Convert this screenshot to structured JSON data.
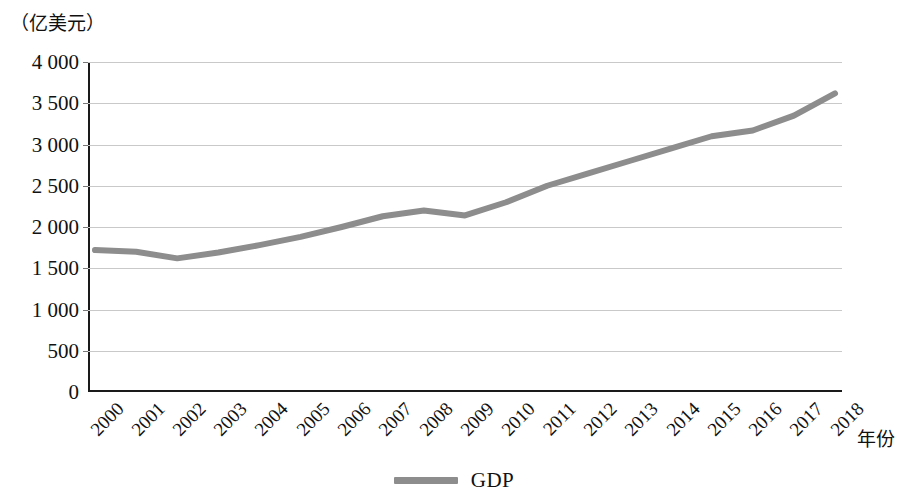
{
  "chart_data": {
    "type": "line",
    "title": "",
    "subtitle": "",
    "xlabel": "年份",
    "ylabel": "（亿美元）",
    "y_unit_caption": "（亿美元）",
    "categories": [
      "2000",
      "2001",
      "2002",
      "2003",
      "2004",
      "2005",
      "2006",
      "2007",
      "2008",
      "2009",
      "2010",
      "2011",
      "2012",
      "2013",
      "2014",
      "2015",
      "2016",
      "2017",
      "2018"
    ],
    "series": [
      {
        "name": "GDP",
        "color": "#8d8d8d",
        "values": [
          1720,
          1700,
          1620,
          1690,
          1780,
          1880,
          2000,
          2130,
          2200,
          2140,
          2300,
          2500,
          2650,
          2800,
          2950,
          3100,
          3170,
          3350,
          3620
        ]
      }
    ],
    "ylim": [
      0,
      4000
    ],
    "ytick_values": [
      0,
      500,
      1000,
      1500,
      2000,
      2500,
      3000,
      3500,
      4000
    ],
    "ytick_labels": [
      "0",
      "500",
      "1 000",
      "1 500",
      "2 000",
      "2 500",
      "3 000",
      "3 500",
      "4 000"
    ],
    "grid": true,
    "grid_axis": "y",
    "legend": {
      "position": "bottom-center",
      "entries": [
        {
          "label": "GDP",
          "color": "#8d8d8d",
          "marker": "line"
        }
      ]
    },
    "xlabel_rotation": -45
  }
}
